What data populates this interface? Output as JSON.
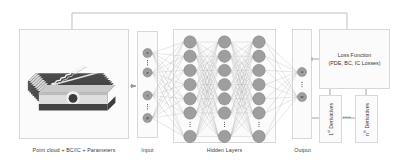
{
  "figure": {
    "background": "#ffffff",
    "stroke_color": "#9a9a9a",
    "node_fill": "#9e9e9e",
    "node_stroke": "#6e6e6e",
    "panel_fill": "#fbfbfb",
    "panel_stroke": "#d8d8d8"
  },
  "captions": {
    "pointcloud": "Point cloud + BC/IC + Parameters",
    "input": "Input",
    "hidden": "Hidden Layers",
    "output": "Output"
  },
  "loss_box": {
    "line1": "Loss Function",
    "line2": "(PDE, BC, IC Losses)"
  },
  "derivatives": {
    "first": {
      "order": "1",
      "sup": "st",
      "text": "Derivatives"
    },
    "nth": {
      "order": "n",
      "sup": "th",
      "text": "Derivatives"
    },
    "ellipsis": "••••"
  },
  "input_layer": {
    "nodes": [
      "x",
      "z",
      "t",
      "p"
    ],
    "ellipsis_between": [
      "0-1",
      "2-3"
    ]
  },
  "output_layer": {
    "nodes": [
      "u",
      "w"
    ],
    "ellipsis_between": [
      "0-1"
    ]
  },
  "hidden_layers": {
    "count": 3,
    "nodes_per_layer": 7,
    "ellipsis_row_index": 6
  },
  "arrows": {
    "pointcloud_to_input": "➡",
    "feedback_loop": "loss-function-back-to-network"
  },
  "pointcloud_art": {
    "description": "stacked cross-section slices of a weld bead with circular pore",
    "slice_count": 9,
    "dark_color": "#4a4a4a",
    "light_color": "#d7d7d7",
    "accent_color": "#e8e8e8",
    "pore_color": "#3c3c3c"
  }
}
